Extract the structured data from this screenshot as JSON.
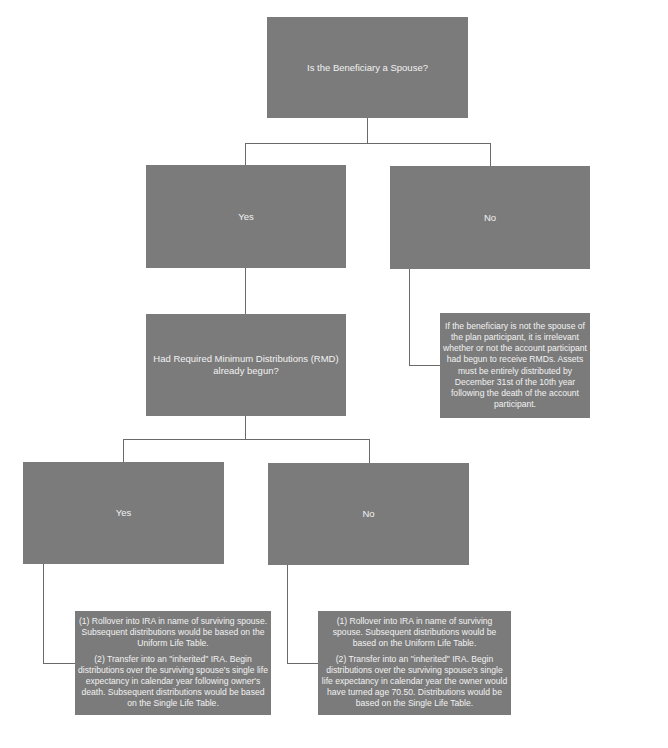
{
  "diagram": {
    "root": {
      "label": "Is the Beneficiary a Spouse?"
    },
    "level1": {
      "yes": {
        "label": "Yes"
      },
      "no": {
        "label": "No"
      },
      "no_outcome": {
        "text": "If the beneficiary is not the spouse of the plan participant, it is irrelevant whether or not the account participant had begun to receive RMDs. Assets must be entirely distributed by December 31st of the 10th year following the death of the account participant."
      }
    },
    "rmd_question": {
      "label": "Had Required Minimum Distributions (RMD) already begun?"
    },
    "level2": {
      "yes": {
        "label": "Yes"
      },
      "no": {
        "label": "No"
      },
      "yes_outcome": {
        "option1": "(1) Rollover into IRA in name of surviving spouse. Subsequent distributions would be based on the Uniform Life Table.",
        "option2": "(2) Transfer into an \"inherited\" IRA. Begin distributions over the surviving spouse's single life expectancy in calendar year following owner's death. Subsequent distributions would be based on the Single Life Table."
      },
      "no_outcome": {
        "option1": "(1) Rollover into IRA in name of surviving spouse. Subsequent distributions would be based on the Uniform Life Table.",
        "option2": "(2) Transfer into an \"inherited\" IRA. Begin distributions over the surviving spouse's single life expectancy in calendar year the owner would have turned age 70.50. Distributions would be based on the Single Life Table."
      }
    },
    "colors": {
      "box_fill": "#7b7b7b",
      "box_text": "#f2f2f2",
      "connector": "#6a6a6a",
      "background": "#ffffff"
    }
  }
}
